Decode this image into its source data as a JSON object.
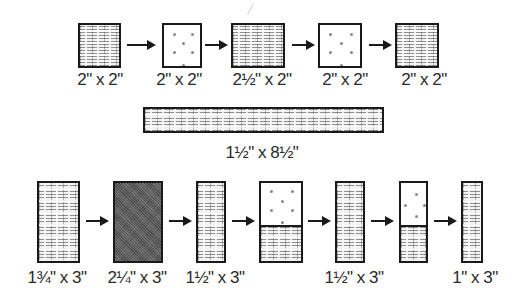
{
  "diagram": {
    "top_row": {
      "pieces": [
        {
          "label": "2\" x 2\"",
          "fill": "weave"
        },
        {
          "label": "2\" x 2\"",
          "fill": "plain-dotted"
        },
        {
          "label": "2½\" x 2\"",
          "fill": "weave"
        },
        {
          "label": "2\" x 2\"",
          "fill": "plain-dotted"
        },
        {
          "label": "2\" x 2\"",
          "fill": "weave"
        }
      ],
      "arrow_count": 4
    },
    "strip": {
      "label": "1½\" x 8½\"",
      "fill": "weave"
    },
    "bottom_row": {
      "pieces": [
        {
          "label": "1¾\" x 3\"",
          "fill": "weave"
        },
        {
          "label": "2¼\" x 3\"",
          "fill": "dark"
        },
        {
          "label": "1½\" x 3\"",
          "fill": "weave"
        },
        {
          "label": "",
          "fill": "split-plain-over-weave"
        },
        {
          "label": "1½\" x 3\"",
          "fill": "weave"
        },
        {
          "label": "",
          "fill": "split-plain-over-weave"
        },
        {
          "label": "1\" x 3\"",
          "fill": "weave"
        }
      ],
      "arrow_count": 6
    },
    "colors": {
      "outline": "#1a1a1a",
      "dark_fill": "#5a5a5a",
      "background": "#ffffff"
    }
  }
}
